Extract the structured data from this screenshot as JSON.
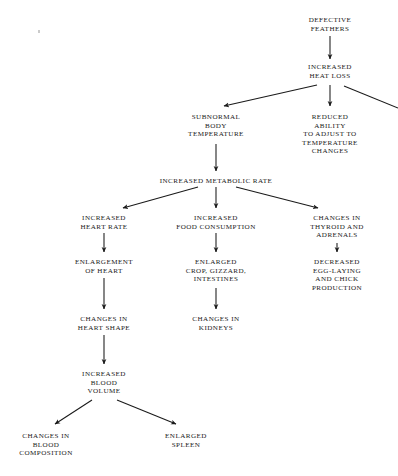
{
  "diagram": {
    "ink_color": "#1a1a1a",
    "background_color": "#ffffff",
    "nodes": [
      {
        "id": "defective_feathers",
        "label": "DEFECTIVE\nFEATHERS",
        "x": 330,
        "y": 16
      },
      {
        "id": "increased_heat_loss",
        "label": "INCREASED\nHEAT LOSS",
        "x": 330,
        "y": 63
      },
      {
        "id": "subnormal_body_temp",
        "label": "SUBNORMAL\nBODY\nTEMPERATURE",
        "x": 216,
        "y": 113
      },
      {
        "id": "reduced_ability",
        "label": "REDUCED ABILITY\nTO ADJUST TO\nTEMPERATURE\nCHANGES",
        "x": 330,
        "y": 113
      },
      {
        "id": "increased_metabolic",
        "label": "INCREASED METABOLIC RATE",
        "x": 216,
        "y": 177
      },
      {
        "id": "increased_heart_rate",
        "label": "INCREASED\nHEART RATE",
        "x": 104,
        "y": 214
      },
      {
        "id": "increased_food",
        "label": "INCREASED\nFOOD CONSUMPTION",
        "x": 216,
        "y": 214
      },
      {
        "id": "changes_thyroid",
        "label": "CHANGES IN\nTHYROID AND\nADRENALS",
        "x": 337,
        "y": 214
      },
      {
        "id": "enlargement_heart",
        "label": "ENLARGEMENT\nOF HEART",
        "x": 104,
        "y": 258
      },
      {
        "id": "enlarged_crop",
        "label": "ENLARGED\nCROP, GIZZARD,\nINTESTINES",
        "x": 216,
        "y": 258
      },
      {
        "id": "decreased_egg",
        "label": "DECREASED\nEGG-LAYING\nAND CHICK\nPRODUCTION",
        "x": 337,
        "y": 258
      },
      {
        "id": "changes_heart_shape",
        "label": "CHANGES IN\nHEART SHAPE",
        "x": 104,
        "y": 315
      },
      {
        "id": "changes_kidneys",
        "label": "CHANGES IN\nKIDNEYS",
        "x": 216,
        "y": 315
      },
      {
        "id": "increased_blood_vol",
        "label": "INCREASED\nBLOOD\nVOLUME",
        "x": 104,
        "y": 370
      },
      {
        "id": "changes_blood_comp",
        "label": "CHANGES IN\nBLOOD\nCOMPOSITION",
        "x": 46,
        "y": 432
      },
      {
        "id": "enlarged_spleen",
        "label": "ENLARGED\nSPLEEN",
        "x": 186,
        "y": 432
      }
    ],
    "edges": [
      {
        "from": "defective_feathers",
        "to": "increased_heat_loss",
        "x1": 330,
        "y1": 36,
        "x2": 330,
        "y2": 59
      },
      {
        "from": "increased_heat_loss",
        "to": "subnormal_body_temp",
        "x1": 317,
        "y1": 85,
        "x2": 224,
        "y2": 106
      },
      {
        "from": "increased_heat_loss",
        "to": "reduced_ability",
        "x1": 330,
        "y1": 85,
        "x2": 330,
        "y2": 106
      },
      {
        "from": "increased_heat_loss",
        "to": "offscreen_right",
        "x1": 344,
        "y1": 86,
        "x2": 398,
        "y2": 108
      },
      {
        "from": "subnormal_body_temp",
        "to": "increased_metabolic",
        "x1": 216,
        "y1": 144,
        "x2": 216,
        "y2": 171
      },
      {
        "from": "increased_metabolic",
        "to": "increased_heart_rate",
        "x1": 198,
        "y1": 187,
        "x2": 123,
        "y2": 208
      },
      {
        "from": "increased_metabolic",
        "to": "increased_food",
        "x1": 216,
        "y1": 187,
        "x2": 216,
        "y2": 208
      },
      {
        "from": "increased_metabolic",
        "to": "changes_thyroid",
        "x1": 236,
        "y1": 187,
        "x2": 318,
        "y2": 208
      },
      {
        "from": "increased_heart_rate",
        "to": "enlargement_heart",
        "x1": 104,
        "y1": 233,
        "x2": 104,
        "y2": 252
      },
      {
        "from": "increased_food",
        "to": "enlarged_crop",
        "x1": 216,
        "y1": 233,
        "x2": 216,
        "y2": 252
      },
      {
        "from": "changes_thyroid",
        "to": "decreased_egg",
        "x1": 337,
        "y1": 243,
        "x2": 337,
        "y2": 252
      },
      {
        "from": "enlargement_heart",
        "to": "changes_heart_shape",
        "x1": 104,
        "y1": 278,
        "x2": 104,
        "y2": 309
      },
      {
        "from": "enlarged_crop",
        "to": "changes_kidneys",
        "x1": 216,
        "y1": 288,
        "x2": 216,
        "y2": 309
      },
      {
        "from": "changes_heart_shape",
        "to": "increased_blood_vol",
        "x1": 104,
        "y1": 335,
        "x2": 104,
        "y2": 364
      },
      {
        "from": "increased_blood_vol",
        "to": "changes_blood_comp",
        "x1": 92,
        "y1": 400,
        "x2": 55,
        "y2": 424
      },
      {
        "from": "increased_blood_vol",
        "to": "enlarged_spleen",
        "x1": 117,
        "y1": 400,
        "x2": 176,
        "y2": 424
      }
    ],
    "artifacts": [
      {
        "id": "scan-speck",
        "x": 38,
        "y": 30
      }
    ]
  }
}
